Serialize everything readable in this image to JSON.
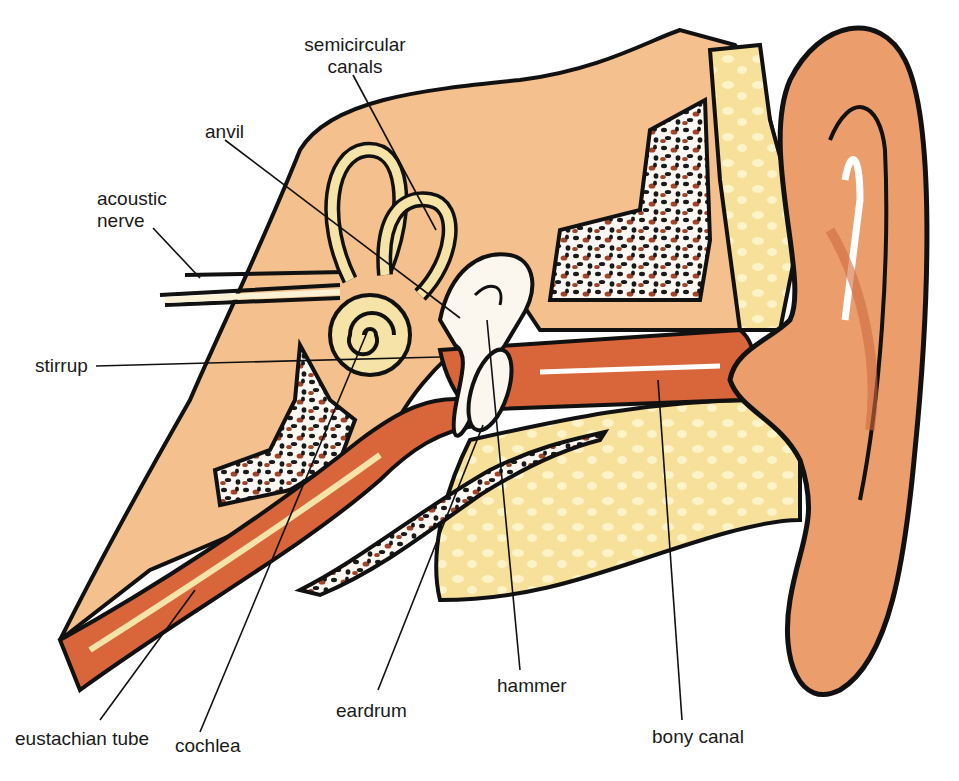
{
  "diagram": {
    "colors": {
      "skin": "#f3b98a",
      "skin_dark": "#e0855a",
      "canal": "#d9653a",
      "bone_tissue": "#f5c793",
      "cartilage": "#f6e3a8",
      "spongy_bone_dot": "#1a1a1a",
      "spongy_bone_red": "#a0452c",
      "outline": "#111111",
      "background": "#ffffff"
    },
    "labels": [
      {
        "id": "semicircular-canals",
        "text_lines": [
          "semicircular",
          "canals"
        ]
      },
      {
        "id": "anvil",
        "text": "anvil"
      },
      {
        "id": "acoustic-nerve",
        "text_lines": [
          "acoustic",
          "nerve"
        ]
      },
      {
        "id": "stirrup",
        "text": "stirrup"
      },
      {
        "id": "eustachian-tube",
        "text": "eustachian tube"
      },
      {
        "id": "cochlea",
        "text": "cochlea"
      },
      {
        "id": "eardrum",
        "text": "eardrum"
      },
      {
        "id": "hammer",
        "text": "hammer"
      },
      {
        "id": "bony-canal",
        "text": "bony canal"
      }
    ]
  }
}
